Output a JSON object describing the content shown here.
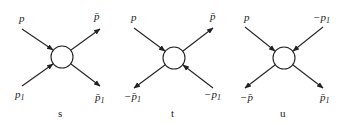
{
  "diagrams": [
    {
      "caption": "s",
      "legs": [
        {
          "position": "top-left",
          "base": "p",
          "bar": false,
          "minus": false,
          "sub": "",
          "arrow": "into-vertex"
        },
        {
          "position": "top-right",
          "base": "p",
          "bar": true,
          "minus": false,
          "sub": "",
          "arrow": "outward"
        },
        {
          "position": "bottom-left",
          "base": "p",
          "bar": false,
          "minus": false,
          "sub": "1",
          "arrow": "into-vertex"
        },
        {
          "position": "bottom-right",
          "base": "p",
          "bar": true,
          "minus": false,
          "sub": "1",
          "arrow": "outward"
        }
      ]
    },
    {
      "caption": "t",
      "legs": [
        {
          "position": "top-left",
          "base": "p",
          "bar": false,
          "minus": false,
          "sub": "",
          "arrow": "into-vertex"
        },
        {
          "position": "top-right",
          "base": "p",
          "bar": true,
          "minus": false,
          "sub": "",
          "arrow": "outward"
        },
        {
          "position": "bottom-left",
          "base": "p",
          "bar": true,
          "minus": true,
          "sub": "1",
          "arrow": "outward"
        },
        {
          "position": "bottom-right",
          "base": "p",
          "bar": false,
          "minus": true,
          "sub": "1",
          "arrow": "into-vertex"
        }
      ]
    },
    {
      "caption": "u",
      "legs": [
        {
          "position": "top-left",
          "base": "p",
          "bar": false,
          "minus": false,
          "sub": "",
          "arrow": "into-vertex"
        },
        {
          "position": "top-right",
          "base": "p",
          "bar": false,
          "minus": true,
          "sub": "1",
          "arrow": "into-vertex"
        },
        {
          "position": "bottom-left",
          "base": "p",
          "bar": true,
          "minus": true,
          "sub": "",
          "arrow": "outward"
        },
        {
          "position": "bottom-right",
          "base": "p",
          "bar": true,
          "minus": false,
          "sub": "1",
          "arrow": "outward"
        }
      ]
    }
  ],
  "labels": {
    "s": {
      "tl": "p",
      "tr": "p̄",
      "bl": "p",
      "bl_sub": "1",
      "br": "p̄",
      "br_sub": "1",
      "caption": "s"
    },
    "t": {
      "tl": "p",
      "tr": "p̄",
      "bl": "−p̄",
      "bl_sub": "1",
      "br": "−p",
      "br_sub": "1",
      "caption": "t"
    },
    "u": {
      "tl": "p",
      "tr": "−p",
      "tr_sub": "1",
      "bl": "−p̄",
      "br": "p̄",
      "br_sub": "1",
      "caption": "u"
    }
  }
}
